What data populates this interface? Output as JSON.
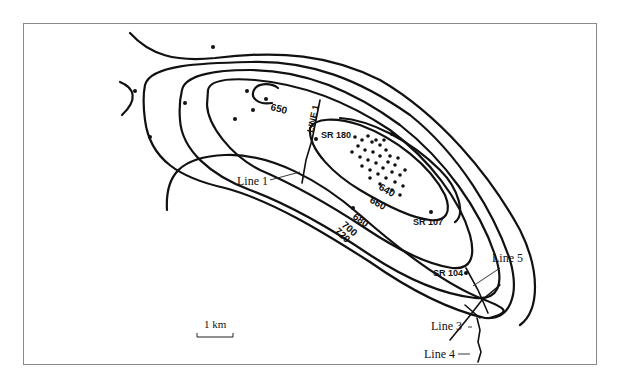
{
  "map": {
    "type": "contour-map",
    "contour_labels": [
      "650",
      "640",
      "660",
      "680",
      "700",
      "720"
    ],
    "wells": [
      {
        "label": "SR 180"
      },
      {
        "label": "SR 107"
      },
      {
        "label": "SR 104"
      }
    ],
    "seismic_lines": [
      {
        "label": "Line 1",
        "inline_label": "LINE 1"
      },
      {
        "label": "Line 3"
      },
      {
        "label": "Line 4"
      },
      {
        "label": "Line 5"
      }
    ],
    "scale_bar": {
      "label": "1 km"
    },
    "colors": {
      "ink": "#111111",
      "frame": "#8a8a8a",
      "background": "#ffffff"
    }
  }
}
